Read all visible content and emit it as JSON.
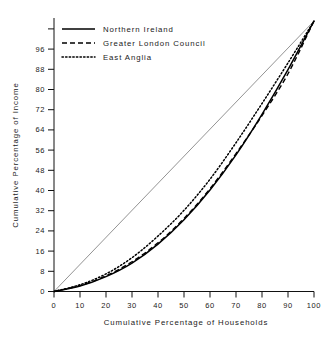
{
  "chart_data": {
    "type": "line",
    "title": "",
    "xlabel": "Cumulative Percentage of Households",
    "ylabel": "Cumulative Percentage of Income",
    "xlim": [
      0,
      100
    ],
    "ylim": [
      0,
      100
    ],
    "xticks": [
      0,
      10,
      20,
      30,
      40,
      50,
      60,
      70,
      80,
      90,
      100
    ],
    "yticks": [
      0,
      8,
      16,
      24,
      32,
      40,
      48,
      56,
      64,
      72,
      80,
      88,
      96
    ],
    "grid": false,
    "legend_position": "top-left",
    "x": [
      0,
      10,
      20,
      30,
      40,
      50,
      60,
      70,
      80,
      90,
      100
    ],
    "series": [
      {
        "name": "Northern Ireland",
        "style": "solid",
        "color": "#000000",
        "values": [
          0,
          2.0,
          5.5,
          10.5,
          17.5,
          26.5,
          37.5,
          50.5,
          65.5,
          82.0,
          100
        ]
      },
      {
        "name": "Greater London Council",
        "style": "dashed",
        "color": "#000000",
        "values": [
          0,
          2.2,
          5.8,
          11.0,
          18.0,
          27.0,
          38.0,
          51.0,
          65.0,
          80.5,
          100
        ]
      },
      {
        "name": "East Anglia",
        "style": "dotted",
        "color": "#000000",
        "values": [
          0,
          2.5,
          6.5,
          12.5,
          20.5,
          30.0,
          41.5,
          55.0,
          69.5,
          84.5,
          100
        ]
      }
    ],
    "reference_line": {
      "name": "line-of-equality",
      "style": "solid-thin",
      "color": "#777777",
      "from": [
        0,
        0
      ],
      "to": [
        100,
        100
      ]
    },
    "axis_titles": {
      "x": "Cumulative Percentage of Households",
      "y": "Cumulative Percentage of Income"
    },
    "xtick_labels": [
      "0",
      "10",
      "20",
      "30",
      "40",
      "50",
      "60",
      "70",
      "80",
      "90",
      "100"
    ],
    "ytick_labels": [
      "0",
      "8",
      "16",
      "24",
      "32",
      "40",
      "48",
      "56",
      "64",
      "72",
      "80",
      "88",
      "96"
    ]
  },
  "legend": {
    "items": [
      {
        "label": "Northern Ireland"
      },
      {
        "label": "Greater London Council"
      },
      {
        "label": "East Anglia"
      }
    ]
  }
}
